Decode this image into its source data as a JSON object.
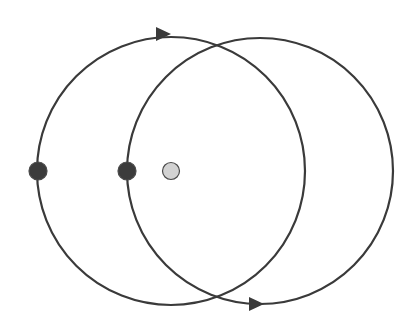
{
  "diagram": {
    "background": "#ffffff",
    "stroke_color": "#3a3a3a",
    "stroke_width": 2.2,
    "circles": [
      {
        "id": "left-orbit",
        "cx": 171,
        "cy": 171,
        "r": 134
      },
      {
        "id": "right-orbit",
        "cx": 260,
        "cy": 171,
        "r": 133
      }
    ],
    "arrows": [
      {
        "id": "top-arrow",
        "x": 163,
        "y": 34,
        "direction": "right",
        "on": "left-orbit"
      },
      {
        "id": "bottom-arrow",
        "x": 256,
        "y": 304,
        "direction": "right",
        "on": "right-orbit"
      }
    ],
    "points": [
      {
        "id": "left-dark-point",
        "x": 38,
        "y": 171,
        "r": 9,
        "fill": "#3c3c3c"
      },
      {
        "id": "middle-dark-point",
        "x": 127,
        "y": 171,
        "r": 9,
        "fill": "#3c3c3c"
      },
      {
        "id": "light-point",
        "x": 171,
        "y": 171,
        "r": 8.5,
        "fill": "#d2d2d2"
      }
    ]
  }
}
